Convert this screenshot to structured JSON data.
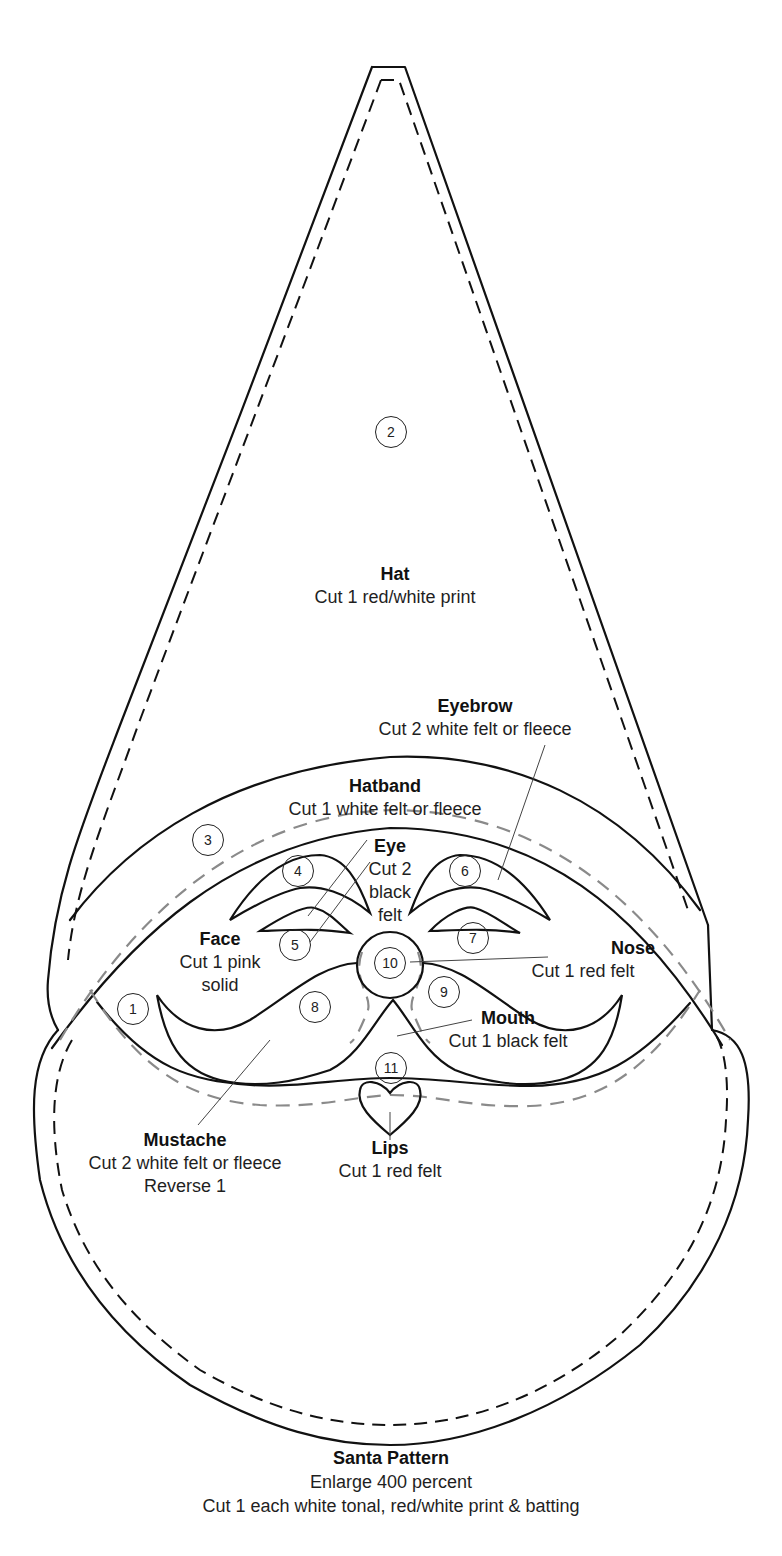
{
  "pieces": {
    "hat": {
      "number": "2",
      "title": "Hat",
      "lines": [
        "Cut 1 red/white print"
      ]
    },
    "eyebrow": {
      "title": "Eyebrow",
      "lines": [
        "Cut 2 white felt or fleece"
      ]
    },
    "hatband": {
      "number": "3",
      "title": "Hatband",
      "lines": [
        "Cut 1 white felt or fleece"
      ]
    },
    "eye": {
      "title": "Eye",
      "lines": [
        "Cut 2",
        "black",
        "felt"
      ]
    },
    "face": {
      "number": "1",
      "title": "Face",
      "lines": [
        "Cut 1 pink",
        "solid"
      ]
    },
    "nose": {
      "number": "10",
      "title": "Nose",
      "lines": [
        "Cut 1 red felt"
      ]
    },
    "mouth": {
      "title": "Mouth",
      "lines": [
        "Cut 1 black felt"
      ]
    },
    "mustache": {
      "title": "Mustache",
      "lines": [
        "Cut 2 white felt or fleece",
        "Reverse 1"
      ]
    },
    "lips": {
      "number": "11",
      "title": "Lips",
      "lines": [
        "Cut 1 red felt"
      ]
    }
  },
  "numbers": {
    "n1": "1",
    "n2": "2",
    "n3": "3",
    "n4": "4",
    "n5": "5",
    "n6": "6",
    "n7": "7",
    "n8": "8",
    "n9": "9",
    "n10": "10",
    "n11": "11"
  },
  "caption": {
    "title": "Santa Pattern",
    "line1": "Enlarge 400 percent",
    "line2": "Cut 1 each white tonal, red/white print & batting"
  },
  "colors": {
    "line": "#111111",
    "seam_gray": "#8a8a8a",
    "background": "#ffffff"
  }
}
